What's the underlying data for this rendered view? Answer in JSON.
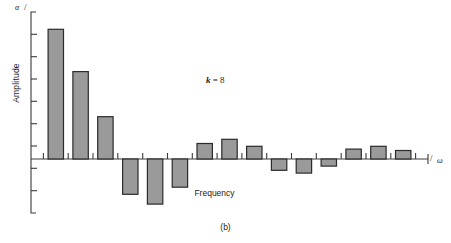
{
  "figure": {
    "caption": "(b)",
    "annotation_prefix": "k",
    "annotation_eq": " = ",
    "annotation_value": "8",
    "yaxis_symbol": "α",
    "xaxis_symbol": "ω",
    "axis_slash": "/"
  },
  "chart_data": {
    "type": "bar",
    "title": "",
    "subtitle": "",
    "annotation": "k = 8",
    "xlabel": "Frequency",
    "ylabel": "Amplitude",
    "xaxis_end_symbol": "ω",
    "yaxis_top_symbol": "α",
    "grid": false,
    "legend": null,
    "ylim": [
      -0.42,
      1.0
    ],
    "xlim": [
      0,
      16
    ],
    "y_tick_count": 9,
    "x_tick_count": 16,
    "bar_fill": "#9a9a9a",
    "bar_stroke": "#2b2b2b",
    "axis_color": "#3a3a3a",
    "categories": [
      1,
      2,
      3,
      4,
      5,
      6,
      7,
      8,
      9,
      10,
      11,
      12,
      13,
      14,
      15
    ],
    "values": [
      0.92,
      0.62,
      0.3,
      -0.25,
      -0.32,
      -0.2,
      0.11,
      0.14,
      0.09,
      -0.08,
      -0.1,
      -0.05,
      0.07,
      0.09,
      0.06
    ],
    "series": [
      {
        "name": "Amplitude",
        "values": [
          0.92,
          0.62,
          0.3,
          -0.25,
          -0.32,
          -0.2,
          0.11,
          0.14,
          0.09,
          -0.08,
          -0.1,
          -0.05,
          0.07,
          0.09,
          0.06
        ]
      }
    ]
  }
}
